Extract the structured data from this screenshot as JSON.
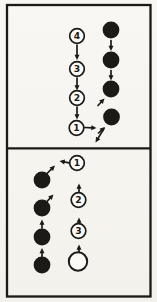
{
  "figure": {
    "colors": {
      "paper": "#f6f5f0",
      "ink": "#1b1a17",
      "circle_fill": "#fbfaf6"
    },
    "frame": {
      "x": 7,
      "y": 5,
      "width": 143.5,
      "height": 291.5,
      "divider_y": 148.3,
      "stroke_width": 2.3
    },
    "panels": [
      {
        "name": "top-panel",
        "nodes": [
          {
            "id": "white-circle-4",
            "kind": "numbered",
            "label": "4",
            "x": 77,
            "y": 36
          },
          {
            "id": "white-circle-3",
            "kind": "numbered",
            "label": "3",
            "x": 77,
            "y": 69
          },
          {
            "id": "white-circle-2",
            "kind": "numbered",
            "label": "2",
            "x": 77,
            "y": 98
          },
          {
            "id": "white-circle-1",
            "kind": "numbered",
            "label": "1",
            "x": 76.5,
            "y": 128
          },
          {
            "id": "black-circle-1",
            "kind": "filled",
            "label": "",
            "x": 111,
            "y": 30
          },
          {
            "id": "black-circle-2",
            "kind": "filled",
            "label": "",
            "x": 111,
            "y": 60
          },
          {
            "id": "black-circle-3",
            "kind": "filled",
            "label": "",
            "x": 111,
            "y": 89
          },
          {
            "id": "black-circle-4",
            "kind": "filled",
            "label": "",
            "x": 111.5,
            "y": 117
          }
        ],
        "arrows": [
          {
            "id": "arrow-4-to-3",
            "from": [
              77,
              45
            ],
            "to": [
              77,
              60
            ]
          },
          {
            "id": "arrow-3-to-2",
            "from": [
              77,
              78
            ],
            "to": [
              77,
              90.5
            ]
          },
          {
            "id": "arrow-2-to-1",
            "from": [
              77,
              107
            ],
            "to": [
              77,
              119.5
            ]
          },
          {
            "id": "arrow-1-right",
            "from": [
              84.5,
              127.5
            ],
            "to": [
              96.5,
              128
            ]
          },
          {
            "id": "arrow-black1-down",
            "from": [
              111,
              40.5
            ],
            "to": [
              111,
              51
            ]
          },
          {
            "id": "arrow-black2-down",
            "from": [
              111,
              70.5
            ],
            "to": [
              111,
              80.5
            ]
          },
          {
            "id": "arrow-into-black3",
            "from": [
              98,
              105.5
            ],
            "to": [
              104.5,
              98.5
            ]
          },
          {
            "id": "arrow-into-black4",
            "from": [
              98.5,
              133
            ],
            "to": [
              105,
              127
            ]
          },
          {
            "id": "arrow-black4-exit",
            "from": [
              104,
              128.5
            ],
            "to": [
              95.5,
              142.5
            ]
          }
        ]
      },
      {
        "name": "bottom-panel",
        "nodes": [
          {
            "id": "black-circle-1",
            "kind": "filled",
            "label": "",
            "x": 42,
            "y": 180
          },
          {
            "id": "black-circle-2",
            "kind": "filled",
            "label": "",
            "x": 42,
            "y": 208
          },
          {
            "id": "black-circle-3",
            "kind": "filled",
            "label": "",
            "x": 42,
            "y": 237
          },
          {
            "id": "black-circle-4",
            "kind": "filled",
            "label": "",
            "x": 42,
            "y": 265
          },
          {
            "id": "white-circle-1",
            "kind": "numbered",
            "label": "1",
            "x": 77,
            "y": 163
          },
          {
            "id": "white-circle-2",
            "kind": "numbered",
            "label": "2",
            "x": 78.5,
            "y": 200
          },
          {
            "id": "white-circle-3",
            "kind": "numbered",
            "label": "3",
            "x": 78.5,
            "y": 231
          },
          {
            "id": "white-circle-empty",
            "kind": "empty",
            "label": "",
            "x": 78,
            "y": 261.5
          }
        ],
        "arrows": [
          {
            "id": "arrow-black1-exit",
            "from": [
              46.5,
              174
            ],
            "to": [
              55,
              165.5
            ]
          },
          {
            "id": "arrow-black2-up",
            "from": [
              46.5,
              202
            ],
            "to": [
              53.5,
              194.5
            ]
          },
          {
            "id": "arrow-black3-up",
            "from": [
              42,
              228
            ],
            "to": [
              42,
              219.5
            ]
          },
          {
            "id": "arrow-black4-up",
            "from": [
              42,
              256.5
            ],
            "to": [
              42,
              248
            ]
          },
          {
            "id": "arrow-empty-to-3",
            "from": [
              79,
              253.5
            ],
            "to": [
              79,
              244.5
            ]
          },
          {
            "id": "arrow-3-to-2",
            "from": [
              79,
              226
            ],
            "to": [
              79,
              217.5
            ]
          },
          {
            "id": "arrow-2-to-1",
            "from": [
              79,
              192.5
            ],
            "to": [
              79,
              183.5
            ]
          },
          {
            "id": "arrow-1-left",
            "from": [
              69,
              162.8
            ],
            "to": [
              59.5,
              161
            ]
          }
        ]
      }
    ]
  }
}
